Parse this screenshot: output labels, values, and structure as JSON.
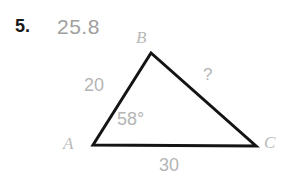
{
  "problem": {
    "number": "5.",
    "answer": "25.8"
  },
  "figure": {
    "type": "triangle",
    "vertices": [
      {
        "name": "A",
        "label": "A",
        "x": 93,
        "y": 145
      },
      {
        "name": "B",
        "label": "B",
        "x": 151,
        "y": 53
      },
      {
        "name": "C",
        "label": "C",
        "x": 256,
        "y": 146
      }
    ],
    "sides": [
      {
        "name": "AB",
        "label": "20",
        "from": "A",
        "to": "B"
      },
      {
        "name": "BC",
        "label": "?",
        "from": "B",
        "to": "C"
      },
      {
        "name": "AC",
        "label": "30",
        "from": "A",
        "to": "C"
      }
    ],
    "angles": [
      {
        "name": "A",
        "label": "58°",
        "vertex": "A"
      }
    ],
    "stroke_color": "#141414",
    "stroke_width": 3,
    "label_color": "#b5b5b5",
    "vertex_label_color": "#b9b9b9"
  },
  "colors": {
    "background": "#ffffff",
    "number_text": "#1a1a1a",
    "answer_text": "#a0a0a0",
    "figure_line": "#141414",
    "annotation": "#b5b5b5"
  }
}
